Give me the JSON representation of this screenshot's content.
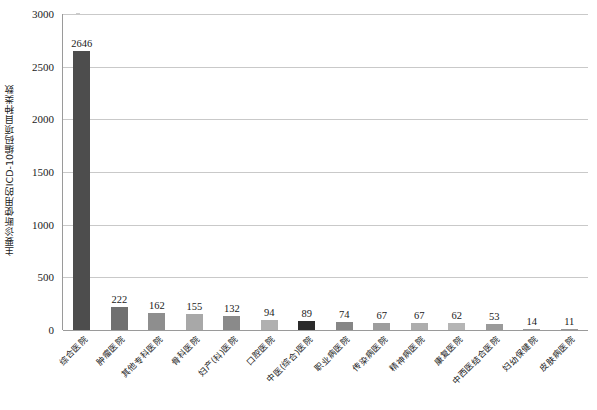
{
  "chart_data": {
    "type": "bar",
    "title": "",
    "xlabel": "",
    "ylabel": "主要诊断使用的ICD-10编码项目种类数",
    "ylim": [
      0,
      3000
    ],
    "ytick_labels": [
      "3000",
      "2500",
      "2000",
      "1500",
      "1000",
      "500",
      "0"
    ],
    "ytick_values": [
      3000,
      2500,
      2000,
      1500,
      1000,
      500,
      0
    ],
    "grid": true,
    "legend": "none",
    "categories": [
      "综合医院",
      "肿瘤医院",
      "其他专科医院",
      "骨科医院",
      "妇产(科)医院",
      "口腔医院",
      "中医(综合)医院",
      "职业病医院",
      "传染病医院",
      "精神病医院",
      "康复医院",
      "中西医结合医院",
      "妇幼保健院",
      "皮肤病医院"
    ],
    "values": [
      2646,
      222,
      162,
      155,
      132,
      94,
      89,
      74,
      67,
      67,
      62,
      53,
      14,
      11
    ],
    "value_labels": [
      "2646",
      "222",
      "162",
      "155",
      "132",
      "94",
      "89",
      "74",
      "67",
      "67",
      "62",
      "53",
      "14",
      "11"
    ],
    "bar_colors": [
      "#4d4d4d",
      "#707070",
      "#8e8e8e",
      "#a8a8a8",
      "#8a8a8a",
      "#b0b0b0",
      "#2b2b2b",
      "#868686",
      "#9d9d9d",
      "#adadad",
      "#b5b5b5",
      "#9a9a9a",
      "#9a9a9a",
      "#9a9a9a"
    ]
  },
  "style": {
    "grid_color": "#c9c9c9",
    "axis_color": "#9a9a9a",
    "text_color": "#1a1a1a",
    "background": "#ffffff"
  }
}
